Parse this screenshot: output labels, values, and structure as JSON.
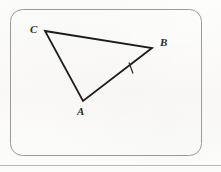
{
  "figure": {
    "type": "geometry-diagram",
    "background_color": "#fbfbfa",
    "frame": {
      "shape": "rounded-rectangle",
      "x": 10,
      "y": 9,
      "width": 192,
      "height": 147,
      "corner_radius": 12,
      "stroke_color": "#9a9a99",
      "stroke_width": 1
    },
    "bottom_rule": {
      "y": 165,
      "x_start": 0,
      "x_end": 221,
      "stroke_color": "#b8b8b7",
      "stroke_width": 1
    },
    "shape": {
      "name": "triangle",
      "stroke_color": "#1c1c1c",
      "stroke_width": 1.8,
      "fill": "none",
      "vertices": [
        {
          "label": "C",
          "x": 45,
          "y": 31,
          "label_x": 30,
          "label_y": 24
        },
        {
          "label": "B",
          "x": 152,
          "y": 48,
          "label_x": 160,
          "label_y": 37
        },
        {
          "label": "A",
          "x": 83,
          "y": 101,
          "label_x": 77,
          "label_y": 106
        }
      ],
      "edges": [
        {
          "name": "CB",
          "from": "C",
          "to": "B"
        },
        {
          "name": "BA",
          "from": "B",
          "to": "A"
        },
        {
          "name": "AC",
          "from": "A",
          "to": "C"
        }
      ]
    },
    "tick_marks": [
      {
        "name": "tick-on-AB",
        "on_edge": "BA",
        "count": 1,
        "x": 131,
        "y": 68,
        "length": 11,
        "rotation_deg": 12,
        "stroke_color": "#2a2a2a",
        "stroke_width": 1.2
      }
    ]
  },
  "labels": {
    "vertex_a": "A",
    "vertex_b": "B",
    "vertex_c": "C"
  }
}
